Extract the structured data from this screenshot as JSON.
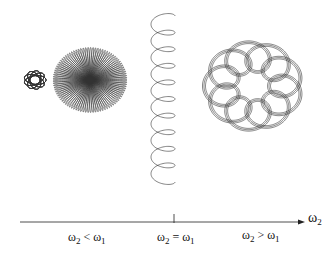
{
  "figure": {
    "curves": [
      {
        "name": "small-rosette",
        "cx": 35,
        "cy": 80,
        "R": 3,
        "r": 8,
        "ratio": -0.8,
        "turns": 25,
        "sy": 0.85
      },
      {
        "name": "large-rosette",
        "cx": 90,
        "cy": 80,
        "R": 19,
        "r": 18,
        "ratio": -0.86,
        "turns": 50,
        "sy": 0.88
      },
      {
        "name": "helix",
        "x": 163,
        "y0": 16,
        "y1": 182,
        "amp": 12,
        "loops": 10
      },
      {
        "name": "loop-ring",
        "cx": 253,
        "cy": 86,
        "R": 26,
        "r": 12,
        "lobes": 10,
        "sy": 0.9
      }
    ],
    "axis": {
      "x_start": 20,
      "x_end": 305,
      "y": 222,
      "tick_x": 174,
      "arrow_label": {
        "main": "ω",
        "sub": "2"
      }
    },
    "regions": [
      {
        "left": "ω",
        "left_sub": "2",
        "op": "<",
        "right": "ω",
        "right_sub": "1",
        "x": 68,
        "y": 236
      },
      {
        "left": "ω",
        "left_sub": "2",
        "op": "=",
        "right": "ω",
        "right_sub": "1",
        "x": 157,
        "y": 236
      },
      {
        "left": "ω",
        "left_sub": "2",
        "op": ">",
        "right": "ω",
        "right_sub": "1",
        "x": 242,
        "y": 234
      }
    ],
    "colors": {
      "ink": "#222222"
    }
  }
}
